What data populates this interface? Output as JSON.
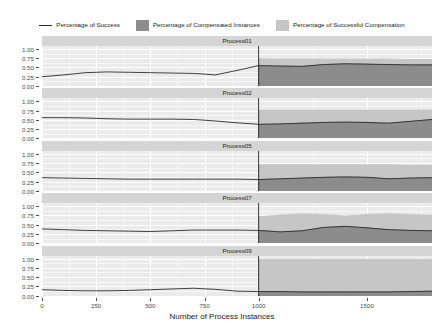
{
  "legend": {
    "position": "top",
    "items": [
      {
        "label": "Percentage of Success",
        "key": "line",
        "color": "#2b2b2b",
        "name": "legend-key-success"
      },
      {
        "label": "Percentage of Compensated Instances",
        "key": "box",
        "color": "#8c8c8c",
        "name": "legend-key-compensated"
      },
      {
        "label": "Percentage of Successful Compensation",
        "key": "box",
        "color": "#c6c6c6",
        "name": "legend-key-successful-compensation"
      }
    ]
  },
  "axes": {
    "x_title": "Number of Process Instances",
    "x_ticks": [
      0,
      250,
      500,
      750,
      1000,
      1500
    ],
    "x_tick_labels": [
      "0",
      "250",
      "500",
      "750",
      "1000",
      "1500"
    ],
    "x_min": 0,
    "x_max": 1800,
    "y_ticks": [
      0.0,
      0.25,
      0.5,
      0.75,
      1.0
    ],
    "y_tick_labels": [
      "0.00",
      "0.25",
      "0.50",
      "0.75",
      "1.00"
    ],
    "y_min": 0,
    "y_max": 1.08
  },
  "style": {
    "panel_background": "#ebebeb",
    "strip_background": "#d5d5d5",
    "gridline_color": "#ffffff",
    "line_color": "#2b2b2b",
    "compensated_color": "#8c8c8c",
    "successful_compensation_color": "#c6c6c6",
    "divider_color": "#1a1a1a"
  },
  "chart_data": {
    "type": "area",
    "title": "",
    "subtitle": "",
    "xlabel": "Number of Process Instances",
    "ylabel": "",
    "xlim": [
      0,
      1800
    ],
    "ylim": [
      0,
      1.08
    ],
    "grid": true,
    "legend_position": "top",
    "facet_variable": "Process",
    "divider_x": 1000,
    "divider_note": "Compensation shading begins at 1000 process instances",
    "legend_entries": [
      "Percentage of Success",
      "Percentage of Compensated Instances",
      "Percentage of Successful Compensation"
    ],
    "series_colors": {
      "Percentage of Success": "#2b2b2b",
      "Percentage of Compensated Instances": "#8c8c8c",
      "Percentage of Successful Compensation": "#c6c6c6"
    },
    "panels": [
      {
        "title": "Process01",
        "x": [
          0,
          100,
          200,
          300,
          400,
          500,
          600,
          700,
          800,
          900,
          1000,
          1100,
          1200,
          1300,
          1400,
          1500,
          1600,
          1700,
          1800
        ],
        "series": [
          {
            "name": "Percentage of Success",
            "values": [
              0.25,
              0.3,
              0.36,
              0.38,
              0.37,
              0.36,
              0.35,
              0.34,
              0.3,
              0.42,
              0.55,
              0.54,
              0.53,
              0.58,
              0.6,
              0.59,
              0.58,
              0.57,
              0.57
            ]
          },
          {
            "name": "Percentage of Compensated Instances",
            "values": [
              0,
              0,
              0,
              0,
              0,
              0,
              0,
              0,
              0,
              0,
              0.56,
              0.55,
              0.54,
              0.59,
              0.61,
              0.6,
              0.59,
              0.58,
              0.58
            ]
          },
          {
            "name": "Percentage of Successful Compensation",
            "values": [
              0,
              0,
              0,
              0,
              0,
              0,
              0,
              0,
              0,
              0,
              0.75,
              0.74,
              0.74,
              0.74,
              0.74,
              0.74,
              0.74,
              0.73,
              0.73
            ]
          }
        ]
      },
      {
        "title": "Process02",
        "x": [
          0,
          100,
          200,
          300,
          400,
          500,
          600,
          700,
          800,
          900,
          1000,
          1100,
          1200,
          1300,
          1400,
          1500,
          1600,
          1700,
          1800
        ],
        "series": [
          {
            "name": "Percentage of Success",
            "values": [
              0.55,
              0.55,
              0.54,
              0.52,
              0.51,
              0.51,
              0.51,
              0.5,
              0.46,
              0.41,
              0.37,
              0.38,
              0.4,
              0.42,
              0.43,
              0.42,
              0.4,
              0.45,
              0.5
            ]
          },
          {
            "name": "Percentage of Compensated Instances",
            "values": [
              0,
              0,
              0,
              0,
              0,
              0,
              0,
              0,
              0,
              0,
              0.38,
              0.39,
              0.41,
              0.43,
              0.44,
              0.43,
              0.41,
              0.46,
              0.51
            ]
          },
          {
            "name": "Percentage of Successful Compensation",
            "values": [
              0,
              0,
              0,
              0,
              0,
              0,
              0,
              0,
              0,
              0,
              0.76,
              0.76,
              0.76,
              0.76,
              0.76,
              0.76,
              0.76,
              0.76,
              0.77
            ]
          }
        ]
      },
      {
        "title": "Process05",
        "x": [
          0,
          100,
          200,
          300,
          400,
          500,
          600,
          700,
          800,
          900,
          1000,
          1100,
          1200,
          1300,
          1400,
          1500,
          1600,
          1700,
          1800
        ],
        "series": [
          {
            "name": "Percentage of Success",
            "values": [
              0.36,
              0.35,
              0.34,
              0.33,
              0.32,
              0.32,
              0.32,
              0.32,
              0.32,
              0.32,
              0.31,
              0.33,
              0.35,
              0.37,
              0.38,
              0.37,
              0.33,
              0.35,
              0.36
            ]
          },
          {
            "name": "Percentage of Compensated Instances",
            "values": [
              0,
              0,
              0,
              0,
              0,
              0,
              0,
              0,
              0,
              0,
              0.32,
              0.34,
              0.36,
              0.38,
              0.39,
              0.38,
              0.34,
              0.36,
              0.37
            ]
          },
          {
            "name": "Percentage of Successful Compensation",
            "values": [
              0,
              0,
              0,
              0,
              0,
              0,
              0,
              0,
              0,
              0,
              0.72,
              0.72,
              0.72,
              0.72,
              0.72,
              0.72,
              0.72,
              0.71,
              0.71
            ]
          }
        ]
      },
      {
        "title": "Process07",
        "x": [
          0,
          100,
          200,
          300,
          400,
          500,
          600,
          700,
          800,
          900,
          1000,
          1100,
          1200,
          1300,
          1400,
          1500,
          1600,
          1700,
          1800
        ],
        "series": [
          {
            "name": "Percentage of Success",
            "values": [
              0.38,
              0.36,
              0.34,
              0.33,
              0.32,
              0.31,
              0.33,
              0.35,
              0.35,
              0.35,
              0.34,
              0.3,
              0.33,
              0.42,
              0.45,
              0.41,
              0.36,
              0.34,
              0.33
            ]
          },
          {
            "name": "Percentage of Compensated Instances",
            "values": [
              0,
              0,
              0,
              0,
              0,
              0,
              0,
              0,
              0,
              0,
              0.35,
              0.31,
              0.34,
              0.43,
              0.46,
              0.42,
              0.37,
              0.35,
              0.34
            ]
          },
          {
            "name": "Percentage of Successful Compensation",
            "values": [
              0,
              0,
              0,
              0,
              0,
              0,
              0,
              0,
              0,
              0,
              0.72,
              0.76,
              0.8,
              0.78,
              0.74,
              0.78,
              0.8,
              0.78,
              0.76
            ]
          }
        ]
      },
      {
        "title": "Process09",
        "x": [
          0,
          100,
          200,
          300,
          400,
          500,
          600,
          700,
          800,
          900,
          1000,
          1100,
          1200,
          1300,
          1400,
          1500,
          1600,
          1700,
          1800
        ],
        "series": [
          {
            "name": "Percentage of Success",
            "values": [
              0.17,
              0.15,
              0.14,
              0.14,
              0.15,
              0.17,
              0.19,
              0.21,
              0.18,
              0.13,
              0.12,
              0.12,
              0.11,
              0.11,
              0.11,
              0.11,
              0.11,
              0.12,
              0.13
            ]
          },
          {
            "name": "Percentage of Compensated Instances",
            "values": [
              0,
              0,
              0,
              0,
              0,
              0,
              0,
              0,
              0,
              0,
              0.13,
              0.13,
              0.12,
              0.12,
              0.12,
              0.12,
              0.12,
              0.13,
              0.14
            ]
          },
          {
            "name": "Percentage of Successful Compensation",
            "values": [
              0,
              0,
              0,
              0,
              0,
              0,
              0,
              0,
              0,
              0,
              1.0,
              1.0,
              1.0,
              1.0,
              1.0,
              1.0,
              1.0,
              1.0,
              1.0
            ]
          }
        ]
      }
    ]
  }
}
